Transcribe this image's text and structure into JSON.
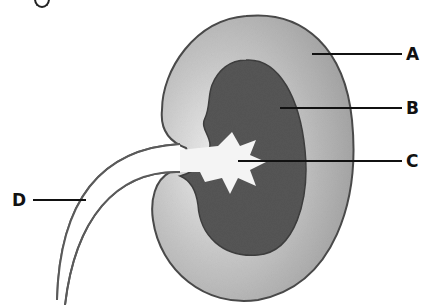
{
  "figure": {
    "title_fragment": "g",
    "type": "kidney cross-section diagram",
    "colors": {
      "outer_layer": "#a8a8a8",
      "outer_layer_light": "#e4e4e4",
      "inner_region": "#555555",
      "pelvis": "#f4f4f4",
      "outline": "#4a4a4a",
      "leader_line": "#111111"
    },
    "labels": [
      {
        "id": "A",
        "text": "A",
        "x": 406,
        "y": 46
      },
      {
        "id": "B",
        "text": "B",
        "x": 406,
        "y": 100
      },
      {
        "id": "C",
        "text": "C",
        "x": 406,
        "y": 153
      },
      {
        "id": "D",
        "text": "D",
        "x": 12,
        "y": 192
      }
    ]
  }
}
